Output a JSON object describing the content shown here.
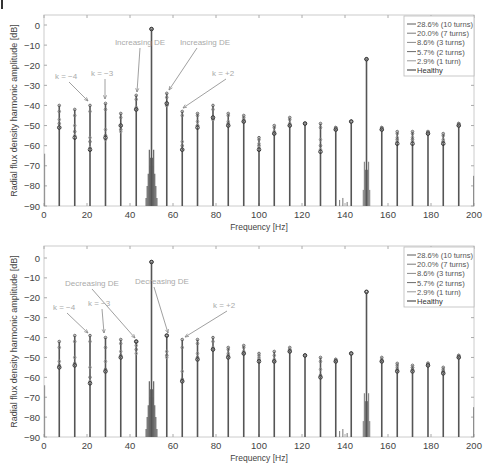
{
  "chart_data": [
    {
      "type": "stem",
      "title": "",
      "xlabel": "Frequency [Hz]",
      "ylabel": "Radial flux density harmonic amplitude [dB]",
      "xlim": [
        0,
        200
      ],
      "ylim": [
        -90,
        5
      ],
      "xticks": [
        0,
        20,
        40,
        60,
        80,
        100,
        120,
        140,
        160,
        180,
        200
      ],
      "yticks": [
        0,
        -10,
        -20,
        -30,
        -40,
        -50,
        -60,
        -70,
        -80,
        -90
      ],
      "grid": false,
      "legend_position": "upper right",
      "legend": [
        "28.6% (10 turns)",
        "20.0% (7 turns)",
        "8.6% (3 turns)",
        "5.7% (2 turns)",
        "2.9% (1 turn)",
        "Healthy"
      ],
      "x": [
        7.1,
        14.3,
        21.4,
        28.6,
        35.7,
        42.9,
        50,
        57.1,
        64.3,
        71.4,
        78.6,
        85.7,
        92.9,
        100,
        107.1,
        114.3,
        121.4,
        128.6,
        135.7,
        142.9,
        150,
        157.1,
        164.3,
        171.4,
        178.6,
        185.7,
        192.9
      ],
      "series": [
        {
          "name": "28.6% (10 turns)",
          "values": [
            -40,
            -42,
            -40,
            -39,
            -44,
            -35,
            -2,
            -34,
            -43,
            -44,
            -40,
            -44,
            -45,
            -56,
            -50,
            -46,
            -49,
            -49,
            -51,
            -48,
            -17,
            -51,
            -53,
            -53,
            -53,
            -54,
            -49
          ]
        },
        {
          "name": "20.0% (7 turns)",
          "values": [
            -43,
            -45,
            -43,
            -42,
            -46,
            -37,
            -2,
            -36,
            -45,
            -45,
            -42,
            -45,
            -46,
            -57,
            -51,
            -47,
            -49,
            -51,
            -51,
            -48,
            -17,
            -51,
            -54,
            -54,
            -53,
            -55,
            -49
          ]
        },
        {
          "name": "8.6% (3 turns)",
          "values": [
            -47,
            -50,
            -56,
            -52,
            -50,
            -41,
            -2,
            -39,
            -58,
            -48,
            -46,
            -48,
            -47,
            -59,
            -53,
            -49,
            -49,
            -57,
            -52,
            -48,
            -17,
            -52,
            -56,
            -56,
            -53,
            -57,
            -50
          ]
        },
        {
          "name": "5.7% (2 turns)",
          "values": [
            -49,
            -53,
            -58,
            -55,
            -52,
            -42,
            -2,
            -40,
            -60,
            -50,
            -47,
            -49,
            -48,
            -60,
            -54,
            -50,
            -49,
            -60,
            -52,
            -48,
            -17,
            -52,
            -57,
            -57,
            -54,
            -58,
            -50
          ]
        },
        {
          "name": "2.9% (1 turn)",
          "values": [
            -51,
            -55,
            -61,
            -57,
            -53,
            -42,
            -2,
            -40,
            -62,
            -50,
            -47,
            -50,
            -48,
            -61,
            -54,
            -50,
            -49,
            -62,
            -52,
            -48,
            -17,
            -52,
            -58,
            -58,
            -54,
            -58,
            -50
          ]
        },
        {
          "name": "Healthy",
          "values": [
            -51,
            -56,
            -62,
            -56,
            -50,
            -42,
            -2,
            -39,
            -62,
            -51,
            -46,
            -50,
            -48,
            -62,
            -54,
            -50,
            -49,
            -63,
            -52,
            -48,
            -17,
            -52,
            -59,
            -59,
            -54,
            -59,
            -50
          ]
        }
      ],
      "annotations": [
        {
          "text": "Increasing DE",
          "target_hz": 42.9
        },
        {
          "text": "Increasing DE",
          "target_hz": 57.1
        },
        {
          "text": "k = −4",
          "target_hz": 21.4
        },
        {
          "text": "k = −3",
          "target_hz": 28.6
        },
        {
          "text": "k = +2",
          "target_hz": 64.3
        }
      ]
    },
    {
      "type": "stem",
      "title": "",
      "xlabel": "Frequency [Hz]",
      "ylabel": "Radial flux density harmonic amplitude [dB]",
      "xlim": [
        0,
        200
      ],
      "ylim": [
        -90,
        5
      ],
      "xticks": [
        0,
        20,
        40,
        60,
        80,
        100,
        120,
        140,
        160,
        180,
        200
      ],
      "yticks": [
        0,
        -10,
        -20,
        -30,
        -40,
        -50,
        -60,
        -70,
        -80,
        -90
      ],
      "grid": false,
      "legend_position": "upper right",
      "legend": [
        "28.6% (10 turns)",
        "20.0% (7 turns)",
        "8.6% (3 turns)",
        "5.7% (2 turns)",
        "2.9% (1 turn)",
        "Healthy"
      ],
      "x": [
        7.1,
        14.3,
        21.4,
        28.6,
        35.7,
        42.9,
        50,
        57.1,
        64.3,
        71.4,
        78.6,
        85.7,
        92.9,
        100,
        107.1,
        114.3,
        121.4,
        128.6,
        135.7,
        142.9,
        150,
        157.1,
        164.3,
        171.4,
        178.6,
        185.7,
        192.9
      ],
      "series": [
        {
          "name": "28.6% (10 turns)",
          "values": [
            -42,
            -39,
            -39,
            -40,
            -41,
            -42,
            -2,
            -39,
            -41,
            -41,
            -40,
            -45,
            -44,
            -48,
            -47,
            -45,
            -49,
            -50,
            -51,
            -48,
            -17,
            -50,
            -53,
            -54,
            -53,
            -55,
            -49
          ]
        },
        {
          "name": "20.0% (7 turns)",
          "values": [
            -45,
            -42,
            -42,
            -45,
            -43,
            -42,
            -2,
            -39,
            -45,
            -43,
            -42,
            -46,
            -45,
            -49,
            -49,
            -46,
            -49,
            -52,
            -51,
            -48,
            -17,
            -51,
            -54,
            -55,
            -53,
            -56,
            -49
          ]
        },
        {
          "name": "8.6% (3 turns)",
          "values": [
            -52,
            -50,
            -55,
            -52,
            -47,
            -44,
            -2,
            -47,
            -57,
            -48,
            -45,
            -48,
            -47,
            -50,
            -51,
            -46,
            -49,
            -56,
            -52,
            -48,
            -17,
            -52,
            -55,
            -55,
            -53,
            -57,
            -50
          ]
        },
        {
          "name": "5.7% (2 turns)",
          "values": [
            -54,
            -53,
            -60,
            -56,
            -49,
            -46,
            -2,
            -49,
            -61,
            -50,
            -46,
            -49,
            -48,
            -51,
            -52,
            -47,
            -49,
            -59,
            -52,
            -48,
            -17,
            -52,
            -56,
            -56,
            -54,
            -57,
            -50
          ]
        },
        {
          "name": "2.9% (1 turn)",
          "values": [
            -55,
            -54,
            -62,
            -57,
            -50,
            -48,
            -2,
            -50,
            -62,
            -51,
            -46,
            -50,
            -48,
            -51,
            -52,
            -47,
            -49,
            -60,
            -52,
            -48,
            -17,
            -52,
            -57,
            -57,
            -54,
            -58,
            -50
          ]
        },
        {
          "name": "Healthy",
          "values": [
            -55,
            -54,
            -63,
            -57,
            -50,
            -42,
            -2,
            -39,
            -62,
            -51,
            -46,
            -50,
            -48,
            -52,
            -52,
            -47,
            -49,
            -60,
            -52,
            -48,
            -17,
            -52,
            -57,
            -57,
            -54,
            -58,
            -50
          ]
        }
      ],
      "annotations": [
        {
          "text": "Decreasing DE",
          "target_hz": 42.9
        },
        {
          "text": "Decreasing DE",
          "target_hz": 57.1
        },
        {
          "text": "k = −4",
          "target_hz": 21.4
        },
        {
          "text": "k = −3",
          "target_hz": 28.6
        },
        {
          "text": "k = +2",
          "target_hz": 64.3
        }
      ]
    }
  ],
  "style": {
    "stem_color": "#555555",
    "marker_color": "#777777",
    "annotation_color": "#aaaaaa",
    "arrow_color": "#888888",
    "axis_color": "#cccccc",
    "text_color": "#444444",
    "series_colors": [
      "#5a5a5a",
      "#7a7a7a",
      "#8a8a8a",
      "#6a6a6a",
      "#999999",
      "#2a2a2a"
    ]
  }
}
